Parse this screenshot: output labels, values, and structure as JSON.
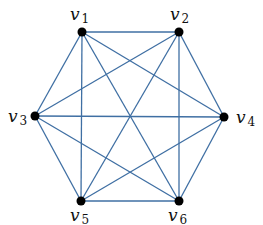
{
  "diagram": {
    "type": "graph",
    "name": "Complete graph on six vertices",
    "edge_color": "#3f6fa3",
    "node_color": "#000000",
    "nodes": [
      {
        "id": "v1",
        "base": "v",
        "sub": "1",
        "x": 82,
        "y": 32,
        "label_x": 70,
        "label_y": 20
      },
      {
        "id": "v2",
        "base": "v",
        "sub": "2",
        "x": 179,
        "y": 32,
        "label_x": 170,
        "label_y": 20
      },
      {
        "id": "v3",
        "base": "v",
        "sub": "3",
        "x": 35,
        "y": 116,
        "label_x": 8,
        "label_y": 122
      },
      {
        "id": "v4",
        "base": "v",
        "sub": "4",
        "x": 224,
        "y": 117,
        "label_x": 236,
        "label_y": 123
      },
      {
        "id": "v5",
        "base": "v",
        "sub": "5",
        "x": 81,
        "y": 201,
        "label_x": 70,
        "label_y": 221
      },
      {
        "id": "v6",
        "base": "v",
        "sub": "6",
        "x": 179,
        "y": 201,
        "label_x": 168,
        "label_y": 221
      }
    ],
    "edges": [
      [
        "v1",
        "v2"
      ],
      [
        "v1",
        "v3"
      ],
      [
        "v1",
        "v4"
      ],
      [
        "v1",
        "v5"
      ],
      [
        "v1",
        "v6"
      ],
      [
        "v2",
        "v3"
      ],
      [
        "v2",
        "v4"
      ],
      [
        "v2",
        "v5"
      ],
      [
        "v2",
        "v6"
      ],
      [
        "v3",
        "v4"
      ],
      [
        "v3",
        "v5"
      ],
      [
        "v3",
        "v6"
      ],
      [
        "v4",
        "v5"
      ],
      [
        "v4",
        "v6"
      ],
      [
        "v5",
        "v6"
      ]
    ]
  }
}
